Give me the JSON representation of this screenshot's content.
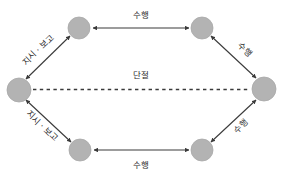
{
  "diagram": {
    "type": "hexagonal-relationship-diagram",
    "colors": {
      "node_fill": "#b3b3b3",
      "node_stroke": "#a8a8a8",
      "edge": "#3a3a3a",
      "dashed_edge": "#3a3a3a",
      "text": "#2b2b2b",
      "background": "#ffffff"
    },
    "nodes": [
      {
        "id": "left",
        "cx": 19,
        "cy": 90,
        "r": 12
      },
      {
        "id": "top-left",
        "cx": 79,
        "cy": 28,
        "r": 11
      },
      {
        "id": "top-right",
        "cx": 202,
        "cy": 28,
        "r": 11
      },
      {
        "id": "right",
        "cx": 264,
        "cy": 89,
        "r": 12
      },
      {
        "id": "bottom-right",
        "cx": 202,
        "cy": 150,
        "r": 11
      },
      {
        "id": "bottom-left",
        "cx": 80,
        "cy": 150,
        "r": 11
      }
    ],
    "edges": [
      {
        "id": "top-horizontal",
        "label": "수행",
        "style": "double-arrow"
      },
      {
        "id": "bottom-horizontal",
        "label": "수행",
        "style": "double-arrow"
      },
      {
        "id": "upper-left-diagonal",
        "label": "지시 · 보고",
        "style": "double-arrow"
      },
      {
        "id": "lower-left-diagonal",
        "label": "지시 · 보고",
        "style": "double-arrow"
      },
      {
        "id": "upper-right-diagonal",
        "label": "수행",
        "style": "double-arrow"
      },
      {
        "id": "lower-right-diagonal",
        "label": "수행",
        "style": "double-arrow"
      },
      {
        "id": "center-dashed",
        "label": "단절",
        "style": "dashed"
      }
    ],
    "labels": {
      "top": "수행",
      "bottom": "수행",
      "upper_left": "지시 · 보고",
      "lower_left": "지시 · 보고",
      "upper_right": "수행",
      "lower_right": "수행",
      "center": "단절"
    }
  }
}
